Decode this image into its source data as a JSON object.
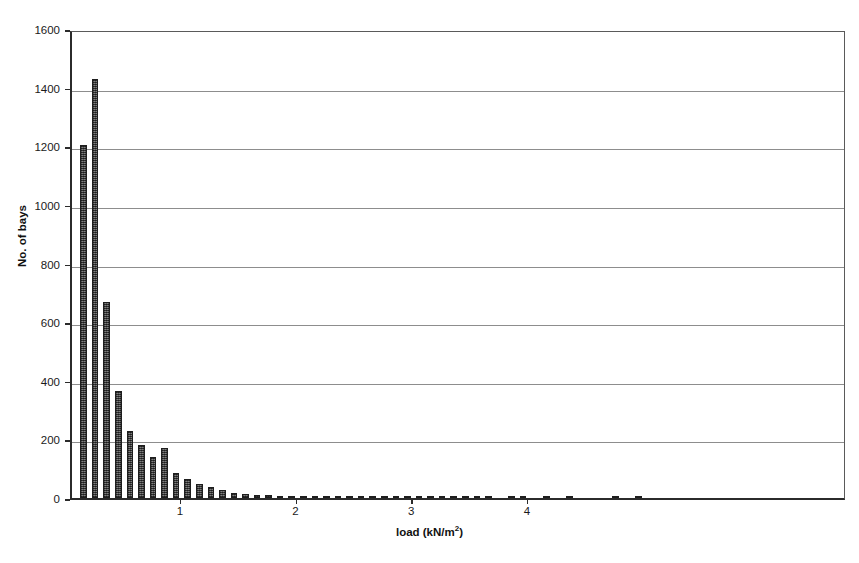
{
  "chart_data": {
    "type": "bar",
    "title": "",
    "xlabel": "load (kN/m2)",
    "xlabel_base": "load (kN/m",
    "xlabel_sup": "2",
    "xlabel_tail": ")",
    "ylabel": "No. of bays",
    "ylim": [
      0,
      1600
    ],
    "ytick_labels": [
      "0",
      "200",
      "400",
      "600",
      "800",
      "1000",
      "1200",
      "1400",
      "1600"
    ],
    "ytick_values": [
      0,
      200,
      400,
      600,
      800,
      1000,
      1200,
      1400,
      1600
    ],
    "xlim": [
      0.05,
      6.75
    ],
    "xtick_labels": [
      "1",
      "2",
      "3",
      "4"
    ],
    "xtick_values": [
      1,
      2,
      3,
      4
    ],
    "grid": "horizontal",
    "legend": "none",
    "bar_color": "#5c5c5c",
    "axis_color": "#2b2b2b",
    "grid_color": "#8d8d8d",
    "x": [
      0.15,
      0.25,
      0.35,
      0.45,
      0.55,
      0.65,
      0.75,
      0.85,
      0.95,
      1.05,
      1.15,
      1.25,
      1.35,
      1.45,
      1.55,
      1.65,
      1.75,
      1.85,
      1.95,
      2.05,
      2.15,
      2.25,
      2.35,
      2.45,
      2.55,
      2.65,
      2.75,
      2.85,
      2.95,
      3.05,
      3.15,
      3.25,
      3.35,
      3.45,
      3.55,
      3.65,
      3.75,
      3.85,
      3.95,
      4.05,
      4.15,
      4.25,
      4.35,
      4.45,
      4.55,
      4.65,
      4.75,
      4.85,
      4.95,
      5.05,
      5.15,
      5.25,
      5.35,
      5.45,
      5.55,
      5.65,
      5.75,
      5.85,
      5.95,
      6.05
    ],
    "values": [
      1205,
      1430,
      670,
      365,
      230,
      180,
      140,
      172,
      85,
      65,
      48,
      38,
      27,
      16,
      12,
      11,
      10,
      8,
      6,
      5,
      4,
      3,
      8,
      3,
      2,
      2,
      3,
      2,
      2,
      1,
      2,
      3,
      1,
      1,
      2,
      1,
      0,
      1,
      1,
      0,
      1,
      0,
      8,
      0,
      0,
      0,
      1,
      0,
      1,
      0,
      0,
      0,
      0,
      0,
      0,
      0,
      0,
      0,
      0,
      0
    ],
    "bar_width_units": 0.057
  }
}
